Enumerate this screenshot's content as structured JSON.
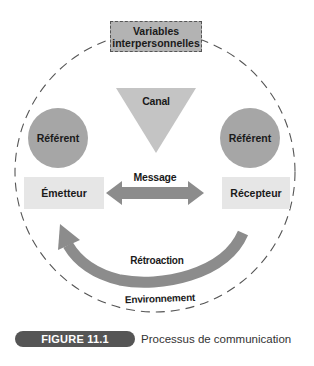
{
  "figure": {
    "label": "FIGURE 11.1",
    "caption": "Processus de communication"
  },
  "diagram": {
    "variables_box": {
      "line1": "Variables",
      "line2": "interpersonnelles"
    },
    "channel": "Canal",
    "referent_left": "Référent",
    "referent_right": "Référent",
    "sender": "Émetteur",
    "receiver": "Récepteur",
    "message": "Message",
    "feedback": "Rétroaction",
    "environment": "Environnement"
  },
  "colors": {
    "dark_gray": "#555555",
    "mid_gray": "#a6a6a6",
    "arrow_gray": "#8c8c8c",
    "light_gray": "#e6e6e6",
    "triangle_gray": "#c4c4c4"
  }
}
